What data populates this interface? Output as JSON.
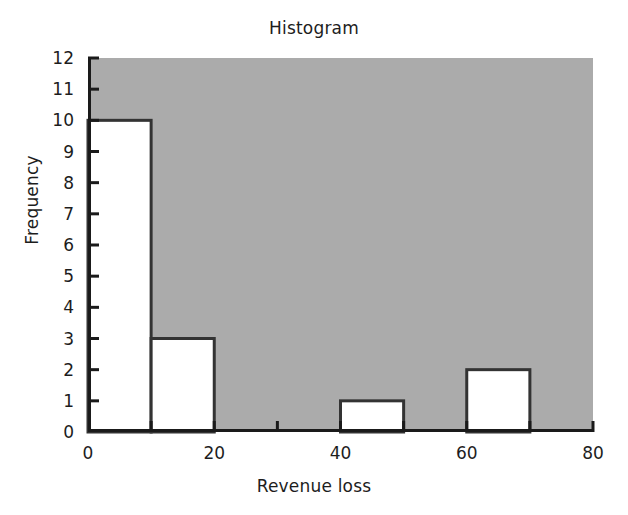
{
  "chart_data": {
    "type": "bar",
    "title": "Histogram",
    "xlabel": "Revenue loss",
    "ylabel": "Frequency",
    "bin_width": 10,
    "bin_edges": [
      0,
      10,
      20,
      30,
      40,
      50,
      60,
      70,
      80
    ],
    "categories": [
      "0-10",
      "10-20",
      "20-30",
      "30-40",
      "40-50",
      "50-60",
      "60-70",
      "70-80"
    ],
    "values": [
      10,
      3,
      0,
      0,
      1,
      0,
      2,
      0
    ],
    "xlim": [
      0,
      80
    ],
    "ylim": [
      0,
      12
    ],
    "x_ticks": [
      0,
      10,
      20,
      30,
      40,
      50,
      60,
      70,
      80
    ],
    "x_tick_labels": [
      "0",
      "",
      "20",
      "",
      "40",
      "",
      "60",
      "",
      "80"
    ],
    "y_ticks": [
      0,
      1,
      2,
      3,
      4,
      5,
      6,
      7,
      8,
      9,
      10,
      11,
      12
    ],
    "y_tick_labels": [
      "0",
      "1",
      "2",
      "3",
      "4",
      "5",
      "6",
      "7",
      "8",
      "9",
      "10",
      "11",
      "12"
    ],
    "grid": false,
    "legend": false,
    "legend_position": "none",
    "plot_background_color": "#ababab",
    "bar_fill_color": "#ffffff",
    "bar_edge_color": "#333333",
    "axis_color": "#1a1a1a",
    "figure_background_color": "#ffffff"
  }
}
